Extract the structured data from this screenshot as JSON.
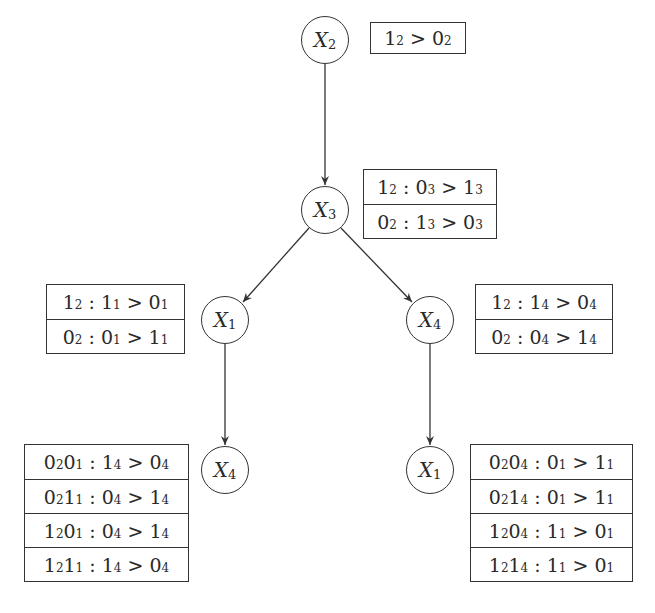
{
  "diagram": {
    "type": "CP-net preference tree",
    "nodes": [
      {
        "id": "n-x2",
        "var": "X",
        "sub": "2",
        "cx": 325,
        "cy": 40
      },
      {
        "id": "n-x3",
        "var": "X",
        "sub": "3",
        "cx": 325,
        "cy": 210
      },
      {
        "id": "n-x1",
        "var": "X",
        "sub": "1",
        "cx": 225,
        "cy": 320
      },
      {
        "id": "n-x4",
        "var": "X",
        "sub": "4",
        "cx": 430,
        "cy": 320
      },
      {
        "id": "n-x4b",
        "var": "X",
        "sub": "4",
        "cx": 225,
        "cy": 470
      },
      {
        "id": "n-x1b",
        "var": "X",
        "sub": "1",
        "cx": 430,
        "cy": 470
      }
    ],
    "edges": [
      {
        "from": "n-x2",
        "to": "n-x3"
      },
      {
        "from": "n-x3",
        "to": "n-x1"
      },
      {
        "from": "n-x3",
        "to": "n-x4"
      },
      {
        "from": "n-x1",
        "to": "n-x4b"
      },
      {
        "from": "n-x4",
        "to": "n-x1b"
      }
    ],
    "tables": {
      "x2": [
        "1₂ > 0₂"
      ],
      "x3": [
        "1₂ : 0₃ > 1₃",
        "0₂ : 1₃ > 0₃"
      ],
      "x1": [
        "1₂ : 1₁ > 0₁",
        "0₂ : 0₁ > 1₁"
      ],
      "x4": [
        "1₂ : 1₄ > 0₄",
        "0₂ : 0₄ > 1₄"
      ],
      "x4b": [
        "0₂0₁ : 1₄ > 0₄",
        "0₂1₁ : 0₄ > 1₄",
        "1₂0₁ : 0₄ > 1₄",
        "1₂1₁ : 1₄ > 0₄"
      ],
      "x1b": [
        "0₂0₄ : 0₁ > 1₁",
        "0₂1₄ : 0₁ > 1₁",
        "1₂0₄ : 1₁ > 0₁",
        "1₂1₄ : 1₁ > 0₁"
      ]
    }
  },
  "labels": {
    "x2": {
      "v": "X",
      "s": "2"
    },
    "x3": {
      "v": "X",
      "s": "3"
    },
    "x1": {
      "v": "X",
      "s": "1"
    },
    "x4": {
      "v": "X",
      "s": "4"
    },
    "x4b": {
      "v": "X",
      "s": "4"
    },
    "x1b": {
      "v": "X",
      "s": "1"
    }
  },
  "rows": {
    "x2": [
      {
        "a": "1",
        "as": "2",
        "b": "",
        "bs": "",
        "l": "",
        "ls": "",
        "rel": " > ",
        "r": "0",
        "rs": "2"
      }
    ],
    "x3": [
      {
        "pre": "1",
        "pres": "2",
        "pre2": "",
        "pre2s": "",
        "l": "0",
        "ls": "3",
        "r": "1",
        "rs": "3"
      },
      {
        "pre": "0",
        "pres": "2",
        "pre2": "",
        "pre2s": "",
        "l": "1",
        "ls": "3",
        "r": "0",
        "rs": "3"
      }
    ],
    "x1": [
      {
        "pre": "1",
        "pres": "2",
        "pre2": "",
        "pre2s": "",
        "l": "1",
        "ls": "1",
        "r": "0",
        "rs": "1"
      },
      {
        "pre": "0",
        "pres": "2",
        "pre2": "",
        "pre2s": "",
        "l": "0",
        "ls": "1",
        "r": "1",
        "rs": "1"
      }
    ],
    "x4": [
      {
        "pre": "1",
        "pres": "2",
        "pre2": "",
        "pre2s": "",
        "l": "1",
        "ls": "4",
        "r": "0",
        "rs": "4"
      },
      {
        "pre": "0",
        "pres": "2",
        "pre2": "",
        "pre2s": "",
        "l": "0",
        "ls": "4",
        "r": "1",
        "rs": "4"
      }
    ],
    "x4b": [
      {
        "pre": "0",
        "pres": "2",
        "pre2": "0",
        "pre2s": "1",
        "l": "1",
        "ls": "4",
        "r": "0",
        "rs": "4"
      },
      {
        "pre": "0",
        "pres": "2",
        "pre2": "1",
        "pre2s": "1",
        "l": "0",
        "ls": "4",
        "r": "1",
        "rs": "4"
      },
      {
        "pre": "1",
        "pres": "2",
        "pre2": "0",
        "pre2s": "1",
        "l": "0",
        "ls": "4",
        "r": "1",
        "rs": "4"
      },
      {
        "pre": "1",
        "pres": "2",
        "pre2": "1",
        "pre2s": "1",
        "l": "1",
        "ls": "4",
        "r": "0",
        "rs": "4"
      }
    ],
    "x1b": [
      {
        "pre": "0",
        "pres": "2",
        "pre2": "0",
        "pre2s": "4",
        "l": "0",
        "ls": "1",
        "r": "1",
        "rs": "1"
      },
      {
        "pre": "0",
        "pres": "2",
        "pre2": "1",
        "pre2s": "4",
        "l": "0",
        "ls": "1",
        "r": "1",
        "rs": "1"
      },
      {
        "pre": "1",
        "pres": "2",
        "pre2": "0",
        "pre2s": "4",
        "l": "1",
        "ls": "1",
        "r": "0",
        "rs": "1"
      },
      {
        "pre": "1",
        "pres": "2",
        "pre2": "1",
        "pre2s": "4",
        "l": "1",
        "ls": "1",
        "r": "0",
        "rs": "1"
      }
    ]
  },
  "symbols": {
    "colon": " : ",
    "gt": " > "
  }
}
